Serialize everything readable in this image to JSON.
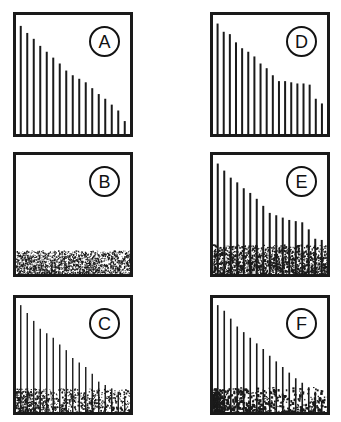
{
  "figure": {
    "background_color": "#ffffff",
    "ink_color": "#1a1a1a",
    "width": 341,
    "height": 422,
    "columns": 2,
    "rows": 3
  },
  "panels": [
    {
      "id": "A",
      "label": "A",
      "column": 0,
      "row": 0,
      "x": 13,
      "y": 12,
      "width": 120,
      "height": 125,
      "label_x": 89,
      "label_y": 26,
      "has_noise_band": false,
      "noise_band_height_frac": 0.0,
      "noise_density": 0,
      "noise_dot_size": 0,
      "noise_left_bias": 0.0,
      "spike_width": 2.0,
      "spike_count": 17
    },
    {
      "id": "B",
      "label": "B",
      "column": 0,
      "row": 1,
      "x": 13,
      "y": 152,
      "width": 120,
      "height": 125,
      "label_x": 89,
      "label_y": 166,
      "has_noise_band": true,
      "noise_band_height_frac": 0.2,
      "noise_density": 1700,
      "noise_dot_size": 1.05,
      "noise_left_bias": 0.0,
      "spike_width": 0,
      "spike_count": 0
    },
    {
      "id": "C",
      "label": "C",
      "column": 0,
      "row": 2,
      "x": 13,
      "y": 295,
      "width": 120,
      "height": 120,
      "label_x": 89,
      "label_y": 308,
      "has_noise_band": true,
      "noise_band_height_frac": 0.21,
      "noise_density": 900,
      "noise_dot_size": 1.25,
      "noise_left_bias": 0.25,
      "spike_width": 1.4,
      "spike_count": 17
    },
    {
      "id": "D",
      "label": "D",
      "column": 1,
      "row": 0,
      "x": 210,
      "y": 12,
      "width": 120,
      "height": 125,
      "label_x": 286,
      "label_y": 26,
      "has_noise_band": false,
      "noise_band_height_frac": 0.0,
      "noise_density": 0,
      "noise_dot_size": 0,
      "noise_left_bias": 0.0,
      "spike_width": 2.0,
      "spike_count": 18
    },
    {
      "id": "E",
      "label": "E",
      "column": 1,
      "row": 1,
      "x": 210,
      "y": 152,
      "width": 120,
      "height": 125,
      "label_x": 286,
      "label_y": 166,
      "has_noise_band": true,
      "noise_band_height_frac": 0.25,
      "noise_density": 1500,
      "noise_dot_size": 1.35,
      "noise_left_bias": 0.0,
      "spike_width": 2.0,
      "spike_count": 17
    },
    {
      "id": "F",
      "label": "F",
      "column": 1,
      "row": 2,
      "x": 210,
      "y": 295,
      "width": 120,
      "height": 120,
      "label_x": 286,
      "label_y": 308,
      "has_noise_band": true,
      "noise_band_height_frac": 0.22,
      "noise_density": 620,
      "noise_dot_size": 1.9,
      "noise_left_bias": 0.6,
      "spike_width": 1.6,
      "spike_count": 17
    }
  ],
  "chart_data": {
    "type": "bar",
    "xlabel": "",
    "ylabel": "",
    "ylim": [
      0,
      1
    ],
    "grid": false,
    "legend": "none",
    "shared_note": "Each panel plots vertical spikes of decaying amplitude (normalized 0-1 of panel height) drawn from the panel floor; some panels add a stippled noise band at the base.",
    "series": [
      {
        "name": "A",
        "panel": "A",
        "noise_band": 0.0,
        "values": [
          0.92,
          0.86,
          0.81,
          0.75,
          0.7,
          0.65,
          0.6,
          0.54,
          0.5,
          0.47,
          0.44,
          0.39,
          0.34,
          0.3,
          0.25,
          0.2,
          0.11
        ]
      },
      {
        "name": "B",
        "panel": "B",
        "noise_band": 0.2,
        "values": []
      },
      {
        "name": "C",
        "panel": "C",
        "noise_band": 0.21,
        "values": [
          0.95,
          0.88,
          0.81,
          0.74,
          0.7,
          0.66,
          0.6,
          0.55,
          0.48,
          0.44,
          0.4,
          0.34,
          0.27,
          0.24,
          0.21,
          0.18,
          0.14
        ]
      },
      {
        "name": "D",
        "panel": "D",
        "noise_band": 0.0,
        "values": [
          0.94,
          0.87,
          0.85,
          0.78,
          0.73,
          0.7,
          0.66,
          0.6,
          0.56,
          0.5,
          0.45,
          0.45,
          0.44,
          0.43,
          0.43,
          0.42,
          0.3,
          0.26
        ]
      },
      {
        "name": "E",
        "panel": "E",
        "noise_band": 0.25,
        "values": [
          0.94,
          0.88,
          0.82,
          0.78,
          0.73,
          0.69,
          0.64,
          0.58,
          0.52,
          0.5,
          0.48,
          0.46,
          0.45,
          0.44,
          0.38,
          0.3,
          0.29
        ]
      },
      {
        "name": "F",
        "panel": "F",
        "noise_band": 0.22,
        "values": [
          0.95,
          0.9,
          0.83,
          0.76,
          0.71,
          0.66,
          0.61,
          0.56,
          0.5,
          0.45,
          0.4,
          0.35,
          0.3,
          0.26,
          0.22,
          0.18,
          0.1
        ]
      }
    ]
  }
}
